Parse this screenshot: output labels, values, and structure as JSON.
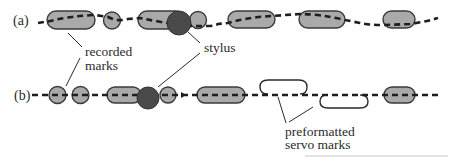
{
  "figure": {
    "rows": [
      {
        "id": "a",
        "label": "(a)"
      },
      {
        "id": "b",
        "label": "(b)"
      }
    ],
    "annotations": {
      "recorded_marks_line1": "recorded",
      "recorded_marks_line2": "marks",
      "stylus": "stylus",
      "servo_line1": "preformatted",
      "servo_line2": "servo marks"
    },
    "colors": {
      "mark_fill": "#a9a9a9",
      "mark_stroke": "#3a3a3a",
      "stylus_fill": "#4a4a4a",
      "track_dash": "#1e1e1e",
      "servo_stroke": "#2a2a2a",
      "background": "#ffffff"
    }
  }
}
